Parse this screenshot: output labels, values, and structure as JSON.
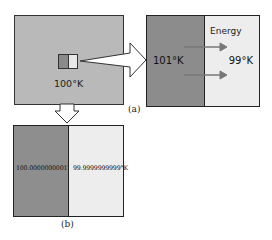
{
  "main_box": {
    "label": "100°K",
    "fill_color": "#b9b9b9"
  },
  "panel_a": {
    "caption": "(a)",
    "hot_side": {
      "label": "101°K",
      "color": "#8c8c8c"
    },
    "cold_side": {
      "label": "99°K",
      "color": "#ededed"
    },
    "flow_label": "Energy",
    "flow_arrows": 2
  },
  "panel_b": {
    "caption": "(b)",
    "hot_side": {
      "label": "100.0000000001°K",
      "color": "#8e8e8e"
    },
    "cold_side": {
      "label": "99.9999999999°K",
      "color": "#ededed"
    }
  }
}
